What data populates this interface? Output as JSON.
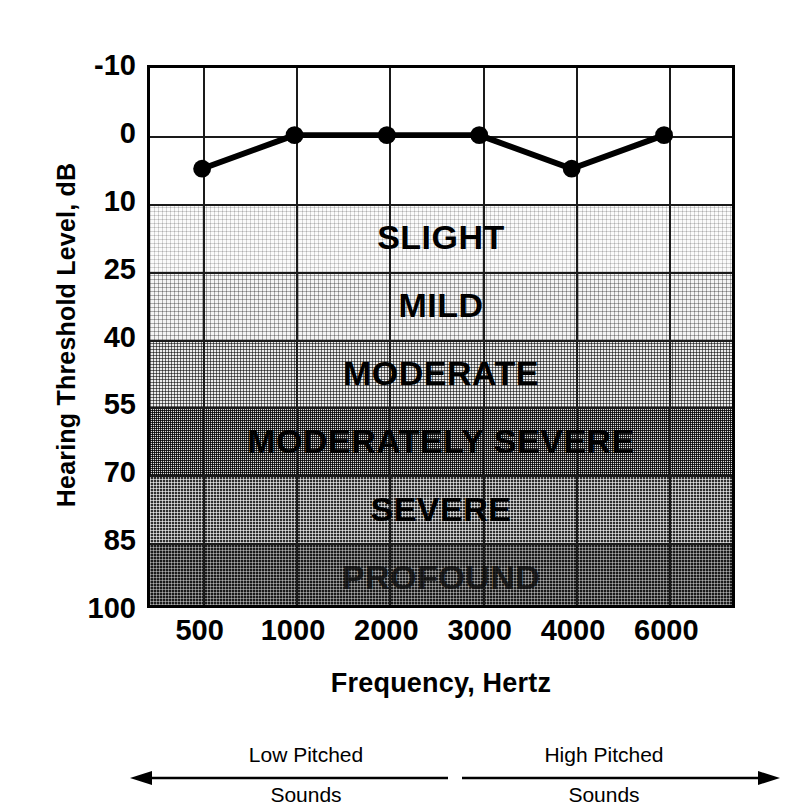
{
  "chart_data": {
    "type": "line",
    "title": "",
    "xlabel": "Frequency, Hertz",
    "ylabel": "Hearing Threshold Level, dB",
    "x_categories": [
      "500",
      "1000",
      "2000",
      "3000",
      "4000",
      "6000"
    ],
    "y_ticks": [
      "-10",
      "0",
      "10",
      "25",
      "40",
      "55",
      "70",
      "85",
      "100"
    ],
    "ylim": [
      -10,
      100
    ],
    "y_axis_inverted": true,
    "grid": true,
    "legend_position": "none",
    "series": [
      {
        "name": "Hearing threshold",
        "values": [
          5,
          0,
          0,
          0,
          5,
          0
        ],
        "marker": "filled-circle"
      }
    ],
    "bands": [
      {
        "label": "",
        "from": -10,
        "to": 0,
        "shade": "d-none"
      },
      {
        "label": "",
        "from": 0,
        "to": 10,
        "shade": "d-none"
      },
      {
        "label": "SLIGHT",
        "from": 10,
        "to": 25,
        "shade": "d-1"
      },
      {
        "label": "MILD",
        "from": 25,
        "to": 40,
        "shade": "d-2"
      },
      {
        "label": "MODERATE",
        "from": 40,
        "to": 55,
        "shade": "d-3"
      },
      {
        "label": "MODERATELY SEVERE",
        "from": 55,
        "to": 70,
        "shade": "d-4"
      },
      {
        "label": "SEVERE",
        "from": 70,
        "to": 85,
        "shade": "d-5"
      },
      {
        "label": "PROFOUND",
        "from": 85,
        "to": 100,
        "shade": "d-6"
      }
    ],
    "annotations": [
      {
        "name": "low-pitched",
        "line1": "Low Pitched",
        "line2": "Sounds",
        "arrow": "left"
      },
      {
        "name": "high-pitched",
        "line1": "High Pitched",
        "line2": "Sounds",
        "arrow": "right"
      }
    ],
    "colors": {
      "axis": "#000000",
      "grid": "#1a1a1a",
      "line": "#000000",
      "marker": "#000000",
      "background": "#ffffff"
    }
  }
}
